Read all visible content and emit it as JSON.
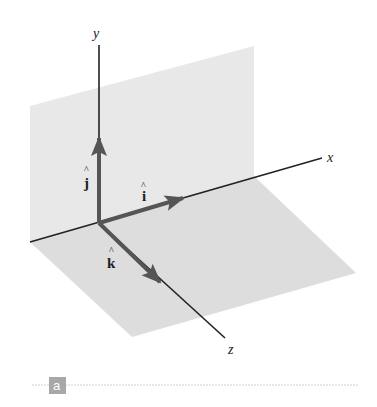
{
  "diagram": {
    "axes": {
      "x": {
        "label": "x"
      },
      "y": {
        "label": "y"
      },
      "z": {
        "label": "z"
      }
    },
    "unit_vectors": [
      {
        "name": "i",
        "label": "i",
        "hat": "^",
        "direction": "x"
      },
      {
        "name": "j",
        "label": "j",
        "hat": "^",
        "direction": "y"
      },
      {
        "name": "k",
        "label": "k",
        "hat": "^",
        "direction": "z"
      }
    ],
    "planes": [
      {
        "name": "xy-plane",
        "color": "#e6e6e6"
      },
      {
        "name": "xz-plane",
        "color": "#dcdcdc"
      }
    ],
    "colors": {
      "axis": "#222222",
      "vector": "#555555",
      "caption_tag_bg": "#a8a8a8",
      "caption_rule": "#cfcfcf"
    }
  },
  "caption": {
    "tag": "a"
  }
}
